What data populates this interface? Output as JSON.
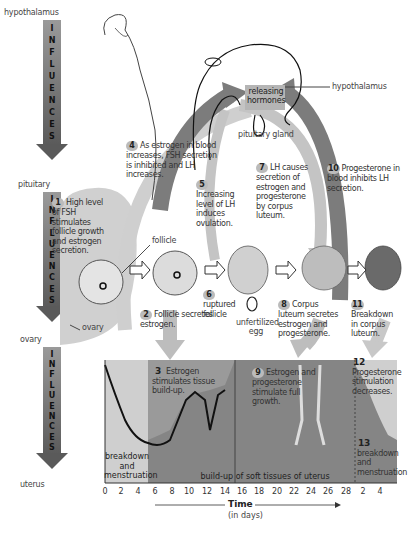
{
  "left_axis": {
    "levels": [
      "hypothalamus",
      "pituitary",
      "ovary",
      "uterus"
    ],
    "influences_word": "INFLUENCES",
    "influences_letters": [
      "I",
      "N",
      "F",
      "L",
      "U",
      "E",
      "N",
      "C",
      "E",
      "S"
    ]
  },
  "top": {
    "hypothalamus_label": "hypothalamus",
    "releasing_hormones_line1": "releasing",
    "releasing_hormones_line2": "hormones",
    "pituitary_label": "pituitary gland"
  },
  "steps": [
    {
      "n": "1",
      "text": "High level of FSH stimulates follicle growth and estrogen secretion."
    },
    {
      "n": "2",
      "text": "Follicle secretes estrogen."
    },
    {
      "n": "3",
      "text": "Estrogen stimulates tissue build-up."
    },
    {
      "n": "4",
      "text": "As estrogen in blood increases, FSH secretion is inhibited and LH increases."
    },
    {
      "n": "5",
      "text": "Increasing level of LH induces ovulation."
    },
    {
      "n": "6",
      "text": "ruptured follicle"
    },
    {
      "n": "7",
      "text": "LH causes secretion of estrogen and progesterone by corpus luteum."
    },
    {
      "n": "8",
      "text": "Corpus luteum secretes estrogen and progesterone."
    },
    {
      "n": "9",
      "text": "Estrogen and progesterone stimulate full growth."
    },
    {
      "n": "10",
      "text": "Progesterone in blood inhibits LH secretion."
    },
    {
      "n": "11",
      "text": "Breakdown in corpus luteum."
    },
    {
      "n": "12",
      "text": "Progesterone stimulation decreases."
    },
    {
      "n": "13",
      "text": "breakdown and menstruation"
    }
  ],
  "ovary": {
    "follicle_label": "follicle",
    "ovary_label": "ovary",
    "unfertilized_egg_label": "unfertilized egg"
  },
  "uterus_chart": {
    "left_phase_label": "breakdown and menstruation",
    "middle_phase_label": "build-up of soft tissues of uterus",
    "x_ticks": [
      "0",
      "2",
      "4",
      "6",
      "8",
      "10",
      "12",
      "14",
      "16",
      "18",
      "20",
      "22",
      "24",
      "26",
      "28",
      "2",
      "4"
    ],
    "x_title": "Time",
    "x_subtitle": "(in days)"
  },
  "colors": {
    "light_gray": "#c8c8c8",
    "mid_gray": "#9e9e9e",
    "dark_gray": "#7a7a7a",
    "arrow_gray": "#8a8a8a"
  }
}
